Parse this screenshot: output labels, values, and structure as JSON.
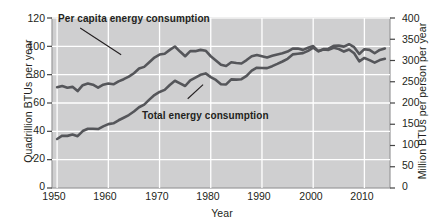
{
  "chart_data": {
    "type": "line",
    "title": "",
    "xlabel": "Year",
    "ylabel": "Quadrillion BTUs per year",
    "ylabel_right": "Million BTUs per person per year",
    "xlim": [
      1949,
      2015
    ],
    "ylim": [
      0,
      120
    ],
    "ylim_right": [
      0,
      400
    ],
    "grid": true,
    "legend_position": "inline-annotations",
    "xticks": [
      "1950",
      "1960",
      "1970",
      "1980",
      "1990",
      "2000",
      "2010"
    ],
    "xtick_values": [
      1950,
      1960,
      1970,
      1980,
      1990,
      2000,
      2010
    ],
    "yticks_left": [
      "0",
      "20",
      "40",
      "60",
      "80",
      "100",
      "120"
    ],
    "ytick_values_left": [
      0,
      20,
      40,
      60,
      80,
      100,
      120
    ],
    "yticks_right": [
      "0",
      "50",
      "100",
      "150",
      "200",
      "250",
      "300",
      "350",
      "400"
    ],
    "ytick_values_right": [
      0,
      50,
      100,
      150,
      200,
      250,
      300,
      350,
      400
    ],
    "series": [
      {
        "name": "Per capita energy consumption",
        "axis": "right",
        "units": "Million BTUs per person per year",
        "color": "#55565a",
        "x": [
          1950,
          1951,
          1952,
          1953,
          1954,
          1955,
          1956,
          1957,
          1958,
          1959,
          1960,
          1961,
          1962,
          1963,
          1964,
          1965,
          1966,
          1967,
          1968,
          1969,
          1970,
          1971,
          1972,
          1973,
          1974,
          1975,
          1976,
          1977,
          1978,
          1979,
          1980,
          1981,
          1982,
          1983,
          1984,
          1985,
          1986,
          1987,
          1988,
          1989,
          1990,
          1991,
          1992,
          1993,
          1994,
          1995,
          1996,
          1997,
          1998,
          1999,
          2000,
          2001,
          2002,
          2003,
          2004,
          2005,
          2006,
          2007,
          2008,
          2009,
          2010,
          2011,
          2012,
          2013,
          2014
        ],
        "values": [
          237,
          240,
          236,
          238,
          228,
          242,
          246,
          243,
          236,
          243,
          246,
          244,
          251,
          256,
          262,
          270,
          281,
          285,
          296,
          307,
          314,
          316,
          325,
          333,
          321,
          310,
          322,
          322,
          325,
          323,
          310,
          300,
          290,
          287,
          296,
          294,
          293,
          301,
          310,
          313,
          310,
          307,
          311,
          314,
          317,
          321,
          328,
          328,
          325,
          330,
          334,
          322,
          326,
          325,
          330,
          327,
          321,
          326,
          317,
          298,
          306,
          301,
          295,
          301,
          304
        ]
      },
      {
        "name": "Total energy consumption",
        "axis": "left",
        "units": "Quadrillion BTUs per year",
        "color": "#55565a",
        "x": [
          1950,
          1951,
          1952,
          1953,
          1954,
          1955,
          1956,
          1957,
          1958,
          1959,
          1960,
          1961,
          1962,
          1963,
          1964,
          1965,
          1966,
          1967,
          1968,
          1969,
          1970,
          1971,
          1972,
          1973,
          1974,
          1975,
          1976,
          1977,
          1978,
          1979,
          1980,
          1981,
          1982,
          1983,
          1984,
          1985,
          1986,
          1987,
          1988,
          1989,
          1990,
          1991,
          1992,
          1993,
          1994,
          1995,
          1996,
          1997,
          1998,
          1999,
          2000,
          2001,
          2002,
          2003,
          2004,
          2005,
          2006,
          2007,
          2008,
          2009,
          2010,
          2011,
          2012,
          2013,
          2014
        ],
        "values": [
          34.6,
          36.9,
          36.8,
          37.7,
          36.6,
          40.2,
          41.8,
          41.8,
          41.6,
          43.5,
          45.1,
          45.7,
          47.8,
          49.6,
          51.5,
          54.0,
          57.0,
          58.9,
          62.4,
          65.6,
          67.8,
          69.3,
          72.7,
          75.7,
          73.9,
          72.0,
          76.0,
          77.9,
          79.9,
          80.9,
          78.3,
          76.3,
          73.2,
          73.1,
          76.7,
          76.5,
          76.8,
          79.2,
          82.8,
          84.9,
          84.7,
          84.6,
          86.0,
          87.6,
          89.3,
          91.2,
          94.3,
          94.8,
          95.2,
          96.8,
          99.0,
          96.5,
          98.0,
          98.3,
          100.4,
          100.5,
          99.8,
          101.5,
          99.4,
          94.6,
          98.0,
          97.5,
          95.1,
          97.5,
          98.5
        ]
      }
    ],
    "annotations": [
      {
        "id": "per-capita",
        "text": "Per capita energy consumption",
        "leader_from": [
          1954.5,
          113
        ],
        "leader_to": [
          1962.5,
          94
        ]
      },
      {
        "id": "total",
        "text": "Total energy consumption",
        "leader_from": [
          1978.5,
          73
        ],
        "leader_to": [
          1975.5,
          63
        ]
      }
    ],
    "colors": {
      "plot_background": "#cfcfd0",
      "gridline": "#ffffff",
      "line": "#55565a",
      "text": "#231f20",
      "axis_border": "#9a9a9c"
    }
  }
}
